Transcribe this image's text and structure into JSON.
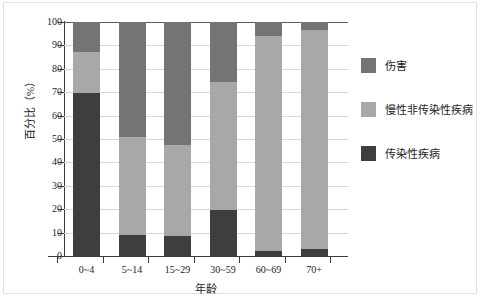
{
  "chart_data": {
    "type": "bar",
    "subtype": "stacked-percentage-column",
    "title": "",
    "xlabel": "年龄",
    "ylabel": "百分比（%）",
    "categories": [
      "0~4",
      "5~14",
      "15~29",
      "30~59",
      "60~69",
      "70+"
    ],
    "ylim": [
      0,
      100
    ],
    "ytick_labels": [
      "0",
      "10",
      "20",
      "30",
      "40",
      "50",
      "60",
      "70",
      "80",
      "90",
      "100"
    ],
    "ytick_values": [
      0,
      10,
      20,
      30,
      40,
      50,
      60,
      70,
      80,
      90,
      100
    ],
    "grid": true,
    "grid_axis": "y",
    "legend_position": "right",
    "stack_order_bottom_to_top": [
      "传染性疾病",
      "慢性非传染性疾病",
      "伤害"
    ],
    "series": [
      {
        "name": "传染性疾病",
        "color": "#3e3e3e",
        "values": [
          69.5,
          9.0,
          8.5,
          19.8,
          2.0,
          3.0
        ]
      },
      {
        "name": "慢性非传染性疾病",
        "color": "#a8a8a8",
        "values": [
          17.5,
          42.0,
          39.0,
          54.7,
          92.0,
          93.5
        ]
      },
      {
        "name": "伤害",
        "color": "#747474",
        "values": [
          13.0,
          49.0,
          52.5,
          25.5,
          6.0,
          3.5
        ]
      }
    ],
    "cumulative_tops": {
      "传染性疾病": [
        69.5,
        9.0,
        8.5,
        19.8,
        2.0,
        3.0
      ],
      "慢性非传染性疾病": [
        87.0,
        51.0,
        47.5,
        74.5,
        94.0,
        96.5
      ],
      "伤害": [
        100,
        100,
        100,
        100,
        100,
        100
      ]
    }
  },
  "legend": {
    "items": [
      {
        "label": "伤害",
        "color": "#747474",
        "swatch_name": "legend-swatch-injuries"
      },
      {
        "label": "慢性非传染性疾病",
        "color": "#a8a8a8",
        "swatch_name": "legend-swatch-chronic-ncd"
      },
      {
        "label": "传染性疾病",
        "color": "#3e3e3e",
        "swatch_name": "legend-swatch-communicable"
      }
    ]
  },
  "axes": {
    "y_title": "百分比（%）",
    "x_title": "年龄"
  },
  "colors": {
    "injuries": "#747474",
    "chronic_ncd": "#a8a8a8",
    "communicable": "#3e3e3e",
    "axis": "#3a3a3a",
    "grid": "#d8d8d8",
    "background": "#ffffff"
  }
}
